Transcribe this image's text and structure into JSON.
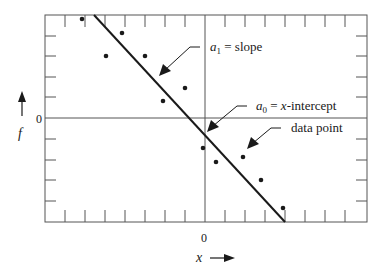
{
  "figure": {
    "type": "linear-regression-diagram",
    "axes": {
      "x_label": "x",
      "y_label": "f",
      "x_zero_label": "0",
      "y_zero_label": "0"
    },
    "annotations": {
      "slope": {
        "sym": "a",
        "sub": "1",
        "text": " = slope"
      },
      "intercept": {
        "sym": "a",
        "sub": "0",
        "text": " = ",
        "var": "x",
        "rest": "-intercept"
      },
      "data_point": "data point"
    },
    "fit_line": {
      "from": [
        94,
        15
      ],
      "to": [
        285,
        222
      ]
    },
    "data_points": [
      [
        82,
        19
      ],
      [
        106,
        56
      ],
      [
        122,
        33
      ],
      [
        145,
        56
      ],
      [
        163,
        101
      ],
      [
        185,
        88
      ],
      [
        203,
        148
      ],
      [
        216,
        162
      ],
      [
        243,
        157
      ],
      [
        261,
        180
      ],
      [
        283,
        208
      ]
    ],
    "colors": {
      "ink": "#1a1a1a",
      "frame": "#555555"
    }
  }
}
